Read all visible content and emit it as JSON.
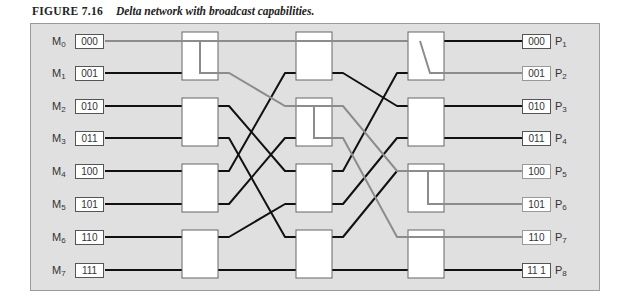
{
  "figure": {
    "number": "FIGURE 7.16",
    "title": "Delta network with broadcast capabilities."
  },
  "colors": {
    "panel_bg": "#e0e0e0",
    "active_line": "#111111",
    "broadcast_line": "#8c8c8c",
    "switch_fill": "#ffffff",
    "switch_border": "#666666"
  },
  "inputs": [
    {
      "label": "M",
      "sub": "0",
      "addr": "000"
    },
    {
      "label": "M",
      "sub": "1",
      "addr": "001"
    },
    {
      "label": "M",
      "sub": "2",
      "addr": "010"
    },
    {
      "label": "M",
      "sub": "3",
      "addr": "011"
    },
    {
      "label": "M",
      "sub": "4",
      "addr": "100"
    },
    {
      "label": "M",
      "sub": "5",
      "addr": "101"
    },
    {
      "label": "M",
      "sub": "6",
      "addr": "110"
    },
    {
      "label": "M",
      "sub": "7",
      "addr": "111"
    }
  ],
  "outputs": [
    {
      "label": "P",
      "sub": "1",
      "addr": "000",
      "path": "black"
    },
    {
      "label": "P",
      "sub": "2",
      "addr": "001",
      "path": "grey"
    },
    {
      "label": "P",
      "sub": "3",
      "addr": "010",
      "path": "black"
    },
    {
      "label": "P",
      "sub": "4",
      "addr": "011",
      "path": "black"
    },
    {
      "label": "P",
      "sub": "5",
      "addr": "100",
      "path": "grey"
    },
    {
      "label": "P",
      "sub": "6",
      "addr": "101",
      "path": "grey"
    },
    {
      "label": "P",
      "sub": "7",
      "addr": "110",
      "path": "grey"
    },
    {
      "label": "P",
      "sub": "8",
      "addr": "11 1",
      "path": "black"
    }
  ],
  "stages": [
    {
      "name": "stage-1",
      "switches": 4
    },
    {
      "name": "stage-2",
      "switches": 4
    },
    {
      "name": "stage-3",
      "switches": 4
    }
  ],
  "broadcast": {
    "source": "M0",
    "destinations": [
      "P2",
      "P5",
      "P6",
      "P7"
    ]
  }
}
